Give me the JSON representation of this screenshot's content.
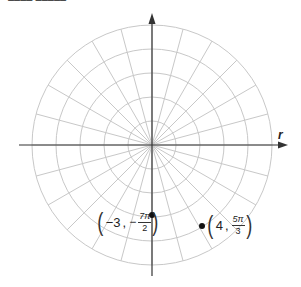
{
  "top_text_fragment": "–––– –––––",
  "grid": {
    "center": [
      152,
      145
    ],
    "ring_spacing": 24,
    "ring_count": 5,
    "spoke_angle_deg": 15,
    "colors": {
      "grid": "#c8c8c8",
      "axis": "#333333",
      "point": "#111111"
    }
  },
  "axes": {
    "horizontal_label": "r"
  },
  "points": [
    {
      "id": "p1",
      "r": "−3",
      "theta_sign": "−",
      "theta_num": "7π",
      "theta_den": "2",
      "screen": [
        152,
        215
      ]
    },
    {
      "id": "p2",
      "r": "4",
      "theta_sign": "",
      "theta_num": "5π",
      "theta_den": "3",
      "screen": [
        202,
        226
      ]
    }
  ]
}
